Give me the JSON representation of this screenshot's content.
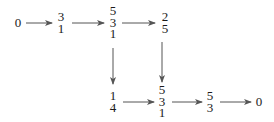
{
  "diagram": {
    "type": "commutative-diagram",
    "nodes": [
      {
        "id": "n0",
        "entries": [
          "0"
        ]
      },
      {
        "id": "n1",
        "entries": [
          "3",
          "1"
        ]
      },
      {
        "id": "n2",
        "entries": [
          "5",
          "3",
          "1"
        ]
      },
      {
        "id": "n3",
        "entries": [
          "2",
          "5"
        ]
      },
      {
        "id": "n4",
        "entries": [
          "1",
          "4"
        ]
      },
      {
        "id": "n5",
        "entries": [
          "5",
          "3",
          "1"
        ]
      },
      {
        "id": "n6",
        "entries": [
          "5",
          "3"
        ]
      },
      {
        "id": "n7",
        "entries": [
          "0"
        ]
      }
    ],
    "edges": [
      {
        "from": "n0",
        "to": "n1",
        "direction": "right"
      },
      {
        "from": "n1",
        "to": "n2",
        "direction": "right"
      },
      {
        "from": "n2",
        "to": "n3",
        "direction": "right"
      },
      {
        "from": "n2",
        "to": "n4",
        "direction": "down"
      },
      {
        "from": "n3",
        "to": "n5",
        "direction": "down"
      },
      {
        "from": "n4",
        "to": "n5",
        "direction": "right"
      },
      {
        "from": "n5",
        "to": "n6",
        "direction": "right"
      },
      {
        "from": "n6",
        "to": "n7",
        "direction": "right"
      }
    ],
    "colors": {
      "line": "#555555",
      "text": "#1a1a1a"
    }
  }
}
